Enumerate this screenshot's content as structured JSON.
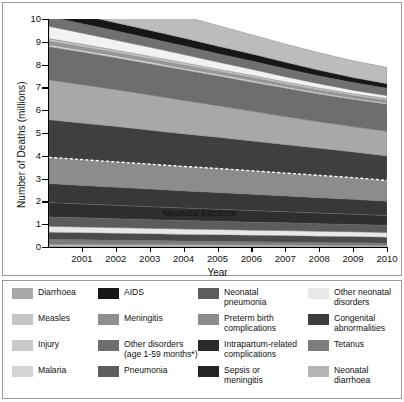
{
  "chart_data": {
    "type": "area",
    "stacked": true,
    "title": "",
    "xlabel": "Year",
    "ylabel": "Number of Deaths (millions)",
    "x": [
      2000,
      2001,
      2002,
      2003,
      2004,
      2005,
      2006,
      2007,
      2008,
      2009,
      2010
    ],
    "xticklabels": [
      "2001",
      "2002",
      "2003",
      "2004",
      "2005",
      "2006",
      "2007",
      "2008",
      "2009",
      "2010"
    ],
    "xlim": [
      2000,
      2010
    ],
    "ylim": [
      0,
      10
    ],
    "yticks": [
      0,
      1,
      2,
      3,
      4,
      5,
      6,
      7,
      8,
      9,
      10
    ],
    "grid": false,
    "legend_position": "below",
    "annotations": [
      {
        "text": "Neonatal fractions",
        "x": 2004.6,
        "y": 1.55
      },
      {
        "text": "dashed-line-neonatal-boundary",
        "y_2000": 3.62,
        "y_2010": 2.92
      }
    ],
    "note": "Stacked from bottom: neonatal causes first (below dashed line), then post-neonatal causes.",
    "series": [
      {
        "name": "Neonatal diarrhoea",
        "color": "#b5b5b5",
        "values": [
          0.13,
          0.13,
          0.12,
          0.12,
          0.11,
          0.11,
          0.1,
          0.1,
          0.09,
          0.09,
          0.08
        ]
      },
      {
        "name": "Tetanus",
        "color": "#7d7d7d",
        "values": [
          0.21,
          0.19,
          0.18,
          0.16,
          0.15,
          0.14,
          0.13,
          0.12,
          0.11,
          0.1,
          0.09
        ]
      },
      {
        "name": "Congenital abnormalities",
        "color": "#4a4a4a",
        "values": [
          0.31,
          0.31,
          0.3,
          0.3,
          0.29,
          0.29,
          0.28,
          0.28,
          0.27,
          0.27,
          0.26
        ]
      },
      {
        "name": "Other neonatal disorders",
        "color": "#e8e8e8",
        "values": [
          0.26,
          0.25,
          0.25,
          0.24,
          0.24,
          0.23,
          0.23,
          0.22,
          0.22,
          0.21,
          0.21
        ]
      },
      {
        "name": "Neonatal pneumonia",
        "color": "#5c5c5c",
        "values": [
          0.41,
          0.4,
          0.39,
          0.38,
          0.37,
          0.36,
          0.35,
          0.34,
          0.33,
          0.32,
          0.31
        ]
      },
      {
        "name": "Sepsis or meningitis",
        "color": "#2e2e2e",
        "values": [
          0.63,
          0.61,
          0.59,
          0.57,
          0.55,
          0.53,
          0.51,
          0.49,
          0.47,
          0.45,
          0.43
        ]
      },
      {
        "name": "Intrapartum-related complications",
        "color": "#383838",
        "values": [
          0.83,
          0.81,
          0.79,
          0.77,
          0.75,
          0.73,
          0.71,
          0.69,
          0.67,
          0.65,
          0.63
        ]
      },
      {
        "name": "Preterm birth complications",
        "color": "#8c8c8c",
        "values": [
          1.15,
          1.13,
          1.11,
          1.09,
          1.07,
          1.05,
          1.03,
          1.0,
          0.98,
          0.95,
          0.91
        ]
      },
      {
        "name": "Pneumonia",
        "color": "#3f3f3f",
        "values": [
          1.65,
          1.6,
          1.55,
          1.49,
          1.43,
          1.37,
          1.31,
          1.25,
          1.19,
          1.13,
          1.07
        ]
      },
      {
        "name": "Diarrhoea",
        "color": "#a8a8a8",
        "values": [
          1.75,
          1.69,
          1.62,
          1.55,
          1.47,
          1.39,
          1.31,
          1.23,
          1.16,
          1.11,
          1.09
        ]
      },
      {
        "name": "Other disorders (age 1-59 months*)",
        "color": "#6e6e6e",
        "values": [
          1.45,
          1.42,
          1.39,
          1.36,
          1.33,
          1.3,
          1.27,
          1.24,
          1.21,
          1.19,
          1.18
        ]
      },
      {
        "name": "Malaria",
        "color": "#cfcfcf",
        "values": [
          0.1,
          0.1,
          0.1,
          0.1,
          0.09,
          0.09,
          0.09,
          0.08,
          0.08,
          0.07,
          0.07
        ]
      },
      {
        "name": "Meningitis",
        "color": "#9a9a9a",
        "values": [
          0.14,
          0.13,
          0.13,
          0.12,
          0.12,
          0.11,
          0.11,
          0.1,
          0.1,
          0.09,
          0.09
        ]
      },
      {
        "name": "Injury",
        "color": "#c2c2c2",
        "values": [
          0.12,
          0.12,
          0.11,
          0.11,
          0.11,
          0.1,
          0.1,
          0.1,
          0.09,
          0.09,
          0.09
        ]
      },
      {
        "name": "Measles",
        "color": "#f2f2f2",
        "values": [
          0.54,
          0.49,
          0.44,
          0.4,
          0.36,
          0.31,
          0.27,
          0.23,
          0.19,
          0.16,
          0.13
        ]
      },
      {
        "name": "Meningitis (1-59 months)",
        "color": "#707070",
        "values": [
          0.42,
          0.41,
          0.4,
          0.39,
          0.38,
          0.37,
          0.36,
          0.35,
          0.34,
          0.33,
          0.32
        ]
      },
      {
        "name": "AIDS",
        "color": "#171717",
        "values": [
          0.38,
          0.37,
          0.36,
          0.35,
          0.34,
          0.33,
          0.31,
          0.28,
          0.25,
          0.22,
          0.2
        ]
      },
      {
        "name": "Other disorders",
        "color": "#bcbcbc",
        "values": [
          1.11,
          1.09,
          1.06,
          1.01,
          0.96,
          0.91,
          0.84,
          0.8,
          0.77,
          0.74,
          0.72
        ]
      }
    ]
  },
  "axes": {
    "y_title": "Number of Deaths (millions)",
    "x_title": "Year",
    "y_ticks": [
      "10",
      "9",
      "8",
      "7",
      "6",
      "5",
      "4",
      "3",
      "2",
      "1",
      "0"
    ],
    "x_ticks": [
      "2001",
      "2002",
      "2003",
      "2004",
      "2005",
      "2006",
      "2007",
      "2008",
      "2009",
      "2010"
    ]
  },
  "annotation": {
    "neonatal_fractions": "Neonatal fractions"
  },
  "legend": {
    "items": [
      {
        "label_line1": "Diarrhoea",
        "label_line2": "",
        "color": "#a8a8a8"
      },
      {
        "label_line1": "AIDS",
        "label_line2": "",
        "color": "#171717"
      },
      {
        "label_line1": "Neonatal",
        "label_line2": "pneumonia",
        "color": "#5c5c5c"
      },
      {
        "label_line1": "Other neonatal",
        "label_line2": "disorders",
        "color": "#e8e8e8"
      },
      {
        "label_line1": "Measles",
        "label_line2": "",
        "color": "#c4c4c4"
      },
      {
        "label_line1": "Meningitis",
        "label_line2": "",
        "color": "#8f8f8f"
      },
      {
        "label_line1": "Preterm birth",
        "label_line2": "complications",
        "color": "#8c8c8c"
      },
      {
        "label_line1": "Congenital",
        "label_line2": "abnormalities",
        "color": "#3d3d3d"
      },
      {
        "label_line1": "Injury",
        "label_line2": "",
        "color": "#cacaca"
      },
      {
        "label_line1": "Other disorders",
        "label_line2": "(age 1-59 months*)",
        "color": "#6e6e6e"
      },
      {
        "label_line1": "Intrapartum-related",
        "label_line2": "complications",
        "color": "#2a2a2a"
      },
      {
        "label_line1": "Tetanus",
        "label_line2": "",
        "color": "#7d7d7d"
      },
      {
        "label_line1": "Malaria",
        "label_line2": "",
        "color": "#d4d4d4"
      },
      {
        "label_line1": "Pneumonia",
        "label_line2": "",
        "color": "#5e5e5e"
      },
      {
        "label_line1": "Sepsis or",
        "label_line2": "meningitis",
        "color": "#232323"
      },
      {
        "label_line1": "Neonatal",
        "label_line2": "diarrhoea",
        "color": "#b5b5b5"
      }
    ]
  }
}
